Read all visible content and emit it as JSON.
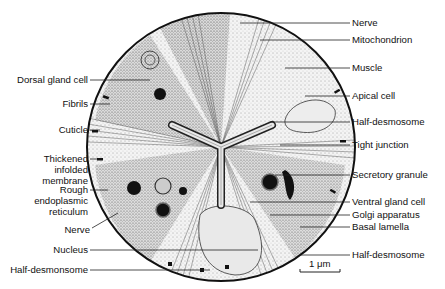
{
  "figure": {
    "scale_bar": {
      "label": "1 μm"
    }
  },
  "labels_left": [
    {
      "id": "dorsal-gland-cell",
      "text": "Dorsal gland cell",
      "lines": [
        "Dorsal gland cell"
      ]
    },
    {
      "id": "fibrils",
      "text": "Fibrils",
      "lines": [
        "Fibrils"
      ]
    },
    {
      "id": "cuticle",
      "text": "Cuticle",
      "lines": [
        "Cuticle"
      ]
    },
    {
      "id": "thickened-infolded-membrane",
      "text": "Thickened infolded membrane",
      "lines": [
        "Thickened",
        "infolded",
        "membrane"
      ]
    },
    {
      "id": "rough-endoplasmic-reticulum",
      "text": "Rough endoplasmic reticulum",
      "lines": [
        "Rough",
        "endoplasmic",
        "reticulum"
      ]
    },
    {
      "id": "nerve-left",
      "text": "Nerve",
      "lines": [
        "Nerve"
      ]
    },
    {
      "id": "nucleus",
      "text": "Nucleus",
      "lines": [
        "Nucleus"
      ]
    },
    {
      "id": "half-desmonsome-left",
      "text": "Half-desmonsome",
      "lines": [
        "Half-desmonsome"
      ]
    }
  ],
  "labels_right": [
    {
      "id": "nerve-right",
      "text": "Nerve"
    },
    {
      "id": "mitochondrion",
      "text": "Mitochondrion"
    },
    {
      "id": "muscle",
      "text": "Muscle"
    },
    {
      "id": "apical-cell",
      "text": "Apical cell"
    },
    {
      "id": "half-desmosome-upper",
      "text": "Half-desmosome"
    },
    {
      "id": "tight-junction",
      "text": "Tight junction"
    },
    {
      "id": "secretory-granule",
      "text": "Secretory granule"
    },
    {
      "id": "ventral-gland-cell",
      "text": "Ventral gland cell"
    },
    {
      "id": "golgi-apparatus",
      "text": "Golgi apparatus"
    },
    {
      "id": "basal-lamella",
      "text": "Basal lamella"
    },
    {
      "id": "half-desmosome-lower",
      "text": "Half-desmosome"
    }
  ]
}
